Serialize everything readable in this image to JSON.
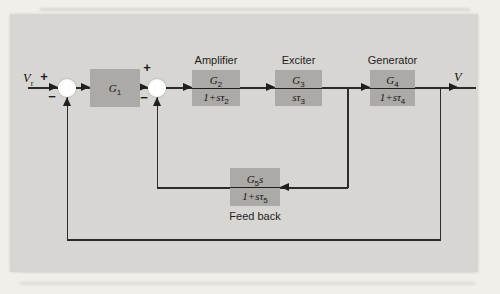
{
  "figure": {
    "kind": "control-system block diagram (AVR: automatic voltage regulator)",
    "colors": {
      "page_bg": "#f1efea",
      "panel_bg": "#d8d6d2",
      "block_fill": "#abaaa6",
      "line": "#2b2b2b",
      "junction_fill": "#ffffff",
      "text": "#1a1a1a"
    }
  },
  "signals": {
    "input": {
      "base": "V",
      "sub": "r"
    },
    "output": "V"
  },
  "junctions": [
    {
      "plus": "+",
      "minus": "−"
    },
    {
      "plus": "+",
      "minus": "−"
    }
  ],
  "blocks": [
    {
      "name": "gain",
      "label": "",
      "num": {
        "base": "G",
        "sub": "1",
        "post": ""
      },
      "den": null
    },
    {
      "name": "amplifier",
      "label": "Amplifier",
      "num": {
        "base": "G",
        "sub": "2",
        "post": ""
      },
      "den": {
        "pre": "1+sτ",
        "sub": "2"
      }
    },
    {
      "name": "exciter",
      "label": "Exciter",
      "num": {
        "base": "G",
        "sub": "3",
        "post": ""
      },
      "den": {
        "pre": "sτ",
        "sub": "3"
      }
    },
    {
      "name": "generator",
      "label": "Generator",
      "num": {
        "base": "G",
        "sub": "4",
        "post": ""
      },
      "den": {
        "pre": "1+sτ",
        "sub": "4"
      }
    },
    {
      "name": "feedback",
      "label": "Feed back",
      "num": {
        "base": "G",
        "sub": "5",
        "post": "s"
      },
      "den": {
        "pre": "1+sτ",
        "sub": "5"
      }
    }
  ]
}
